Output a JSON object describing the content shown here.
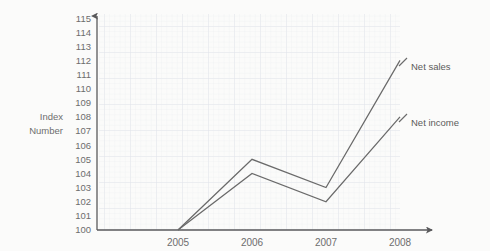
{
  "chart_data": {
    "type": "line",
    "title": "",
    "subtitle": "",
    "xlabel": "",
    "ylabel": "Index Number",
    "ylabel_line1": "Index",
    "ylabel_line2": "Number",
    "categories": [
      "2005",
      "2006",
      "2007",
      "2008"
    ],
    "x": [
      2005,
      2006,
      2007,
      2008
    ],
    "xlim": [
      2005,
      2008
    ],
    "ylim": [
      100,
      115
    ],
    "ytick_labels": [
      "115",
      "114",
      "113",
      "112",
      "111",
      "110",
      "109",
      "108",
      "107",
      "106",
      "105",
      "104",
      "103",
      "102",
      "101",
      "100"
    ],
    "yticks": [
      115,
      114,
      113,
      112,
      111,
      110,
      109,
      108,
      107,
      106,
      105,
      104,
      103,
      102,
      101,
      100
    ],
    "xtick_labels": [
      "2005",
      "2006",
      "2007",
      "2008"
    ],
    "grid": true,
    "grid_style": "graph-paper",
    "legend": "inline-end-labels",
    "legend_position": "right",
    "series": [
      {
        "name": "Net sales",
        "label": "Net sales",
        "color": "#6a6a6a",
        "values": [
          100,
          105,
          103,
          112
        ]
      },
      {
        "name": "Net income",
        "label": "Net income",
        "color": "#6a6a6a",
        "values": [
          100,
          104,
          102,
          108
        ]
      }
    ]
  },
  "colors": {
    "background": "#fbfbfa",
    "grid_minor": "#eceef1",
    "grid_major": "#e2e5ea",
    "axis": "#59595b",
    "line": "#6a6a6a",
    "text": "#6d6d6d"
  }
}
